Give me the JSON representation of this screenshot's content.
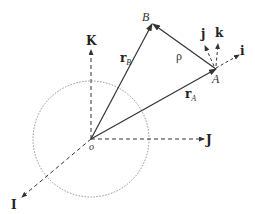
{
  "labels": {
    "B": "B",
    "A": "A",
    "origin": "o",
    "K": "K",
    "J": "J",
    "I": "I",
    "i": "i",
    "j": "j",
    "k": "k",
    "rho": "ρ",
    "rB_main": "r",
    "rB_sub": "B",
    "rA_main": "r",
    "rA_sub": "A"
  },
  "colors": {
    "line": "#333333",
    "circle": "#777777",
    "background": "#ffffff"
  },
  "geometry": {
    "origin": [
      91,
      139
    ],
    "circle_radius": 58,
    "point_A": [
      216,
      69
    ],
    "point_B": [
      152,
      24
    ]
  }
}
